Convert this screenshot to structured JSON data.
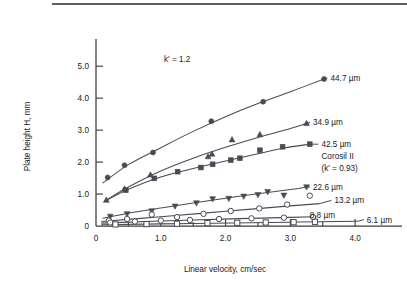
{
  "chart_data": {
    "type": "line",
    "title": "",
    "xlabel": "Linear velocity, cm/sec",
    "ylabel": "Plate height H, mm",
    "xlim": [
      0,
      4.6
    ],
    "ylim": [
      0,
      5.6
    ],
    "xticks": [
      "0",
      "1.0",
      "2.0",
      "3.0",
      "4.0"
    ],
    "xtick_values": [
      0,
      1.0,
      2.0,
      3.0,
      4.0
    ],
    "xminor_values": [
      0.5,
      1.5,
      2.5,
      3.5
    ],
    "yticks": [
      "0",
      "1.0",
      "2.0",
      "3.0",
      "4.0",
      "5.0"
    ],
    "ytick_values": [
      0,
      1.0,
      2.0,
      3.0,
      4.0,
      5.0
    ],
    "grid": false,
    "legend_position": "right-inline-labels",
    "annotations": [
      {
        "text": "k' = 1.2",
        "x": 1.05,
        "y": 5.12
      }
    ],
    "series": [
      {
        "name": "44.7 µm",
        "label": "44.7 µm",
        "marker": "filled-circle",
        "label_x": 3.62,
        "label_y": 4.62,
        "points": [
          {
            "x": 0.18,
            "y": 1.52
          },
          {
            "x": 0.44,
            "y": 1.9
          },
          {
            "x": 0.88,
            "y": 2.3
          },
          {
            "x": 1.78,
            "y": 3.28
          },
          {
            "x": 2.58,
            "y": 3.89
          },
          {
            "x": 3.52,
            "y": 4.6
          }
        ],
        "curve": [
          {
            "x": 0.1,
            "y": 1.34
          },
          {
            "x": 0.5,
            "y": 1.92
          },
          {
            "x": 1.0,
            "y": 2.45
          },
          {
            "x": 1.5,
            "y": 2.96
          },
          {
            "x": 2.0,
            "y": 3.42
          },
          {
            "x": 2.5,
            "y": 3.83
          },
          {
            "x": 3.0,
            "y": 4.2
          },
          {
            "x": 3.52,
            "y": 4.6
          }
        ]
      },
      {
        "name": "34.9 µm",
        "label": "34.9 µm",
        "marker": "filled-triangle-up",
        "label_x": 3.35,
        "label_y": 3.24,
        "points": [
          {
            "x": 0.16,
            "y": 0.81
          },
          {
            "x": 0.44,
            "y": 1.16
          },
          {
            "x": 0.84,
            "y": 1.6
          },
          {
            "x": 1.73,
            "y": 2.17
          },
          {
            "x": 1.79,
            "y": 2.25
          },
          {
            "x": 2.1,
            "y": 2.7
          },
          {
            "x": 2.53,
            "y": 2.86
          },
          {
            "x": 3.25,
            "y": 3.21
          }
        ],
        "curve": [
          {
            "x": 0.14,
            "y": 0.79
          },
          {
            "x": 0.5,
            "y": 1.22
          },
          {
            "x": 1.0,
            "y": 1.72
          },
          {
            "x": 1.5,
            "y": 2.12
          },
          {
            "x": 2.0,
            "y": 2.46
          },
          {
            "x": 2.5,
            "y": 2.77
          },
          {
            "x": 3.0,
            "y": 3.05
          },
          {
            "x": 3.25,
            "y": 3.21
          }
        ]
      },
      {
        "name": "42.5 µm Corosil II",
        "label": "42.5 µm",
        "label_line2": "Corosil II",
        "label_line3": "(k' = 0.93)",
        "marker": "filled-square",
        "label_x": 3.48,
        "label_y": 2.56,
        "points": [
          {
            "x": 0.46,
            "y": 1.12
          },
          {
            "x": 0.9,
            "y": 1.49
          },
          {
            "x": 1.26,
            "y": 1.7
          },
          {
            "x": 1.62,
            "y": 1.83
          },
          {
            "x": 1.8,
            "y": 1.93
          },
          {
            "x": 2.08,
            "y": 2.06
          },
          {
            "x": 2.22,
            "y": 2.12
          },
          {
            "x": 2.53,
            "y": 2.37
          },
          {
            "x": 2.88,
            "y": 2.48
          },
          {
            "x": 3.3,
            "y": 2.56
          }
        ],
        "curve": [
          {
            "x": 0.12,
            "y": 0.76
          },
          {
            "x": 0.5,
            "y": 1.15
          },
          {
            "x": 1.0,
            "y": 1.53
          },
          {
            "x": 1.5,
            "y": 1.8
          },
          {
            "x": 2.0,
            "y": 2.03
          },
          {
            "x": 2.5,
            "y": 2.26
          },
          {
            "x": 2.9,
            "y": 2.44
          },
          {
            "x": 3.3,
            "y": 2.56
          }
        ]
      },
      {
        "name": "22.6 µm",
        "label": "22.6 µm",
        "marker": "filled-triangle-down",
        "label_x": 3.35,
        "label_y": 1.22,
        "points": [
          {
            "x": 0.22,
            "y": 0.3
          },
          {
            "x": 0.48,
            "y": 0.38
          },
          {
            "x": 0.86,
            "y": 0.47
          },
          {
            "x": 1.22,
            "y": 0.62
          },
          {
            "x": 1.55,
            "y": 0.72
          },
          {
            "x": 1.8,
            "y": 0.85
          },
          {
            "x": 2.05,
            "y": 0.86
          },
          {
            "x": 2.28,
            "y": 0.93
          },
          {
            "x": 2.5,
            "y": 0.98
          },
          {
            "x": 2.65,
            "y": 1.07
          },
          {
            "x": 2.9,
            "y": 0.96
          },
          {
            "x": 3.25,
            "y": 1.22
          }
        ],
        "curve": [
          {
            "x": 0.1,
            "y": 0.24
          },
          {
            "x": 0.5,
            "y": 0.4
          },
          {
            "x": 1.0,
            "y": 0.56
          },
          {
            "x": 1.5,
            "y": 0.72
          },
          {
            "x": 2.0,
            "y": 0.87
          },
          {
            "x": 2.5,
            "y": 1.01
          },
          {
            "x": 3.0,
            "y": 1.14
          },
          {
            "x": 3.25,
            "y": 1.22
          }
        ]
      },
      {
        "name": "13.2 µm",
        "label": "13.2 µm",
        "marker": "open-circle",
        "label_x": 3.68,
        "label_y": 0.8,
        "points": [
          {
            "x": 0.2,
            "y": 0.17
          },
          {
            "x": 0.48,
            "y": 0.22
          },
          {
            "x": 0.86,
            "y": 0.36
          },
          {
            "x": 1.25,
            "y": 0.28
          },
          {
            "x": 1.66,
            "y": 0.38
          },
          {
            "x": 2.08,
            "y": 0.47
          },
          {
            "x": 2.52,
            "y": 0.55
          },
          {
            "x": 2.95,
            "y": 0.67
          },
          {
            "x": 3.3,
            "y": 0.95
          }
        ],
        "curve": [
          {
            "x": 0.08,
            "y": 0.14
          },
          {
            "x": 1.0,
            "y": 0.29
          },
          {
            "x": 2.0,
            "y": 0.46
          },
          {
            "x": 3.0,
            "y": 0.63
          },
          {
            "x": 3.45,
            "y": 0.7
          }
        ]
      },
      {
        "name": "8.8 µm",
        "label": "8.8 µm",
        "marker": "open-circle",
        "label_x": 3.3,
        "label_y": 0.33,
        "points": [
          {
            "x": 0.22,
            "y": 0.11
          },
          {
            "x": 0.6,
            "y": 0.14
          },
          {
            "x": 1.0,
            "y": 0.17
          },
          {
            "x": 1.45,
            "y": 0.19
          },
          {
            "x": 1.9,
            "y": 0.22
          },
          {
            "x": 2.4,
            "y": 0.24
          },
          {
            "x": 2.9,
            "y": 0.26
          },
          {
            "x": 3.35,
            "y": 0.28
          }
        ],
        "curve": [
          {
            "x": 0.08,
            "y": 0.09
          },
          {
            "x": 1.5,
            "y": 0.19
          },
          {
            "x": 3.0,
            "y": 0.27
          },
          {
            "x": 3.4,
            "y": 0.29
          }
        ]
      },
      {
        "name": "6.1 µm",
        "label": "6.1 µm",
        "marker": "open-square",
        "label_x": 4.18,
        "label_y": 0.2,
        "points": [
          {
            "x": 0.3,
            "y": 0.05
          },
          {
            "x": 0.78,
            "y": 0.06
          },
          {
            "x": 1.25,
            "y": 0.07
          },
          {
            "x": 1.72,
            "y": 0.09
          },
          {
            "x": 2.18,
            "y": 0.1
          },
          {
            "x": 2.62,
            "y": 0.11
          },
          {
            "x": 3.05,
            "y": 0.12
          },
          {
            "x": 3.38,
            "y": 0.13
          }
        ],
        "curve": [
          {
            "x": 0.08,
            "y": 0.04
          },
          {
            "x": 1.5,
            "y": 0.08
          },
          {
            "x": 3.0,
            "y": 0.12
          },
          {
            "x": 4.05,
            "y": 0.15
          }
        ]
      }
    ]
  },
  "colors": {
    "ink": "#4a4a55",
    "axis": "#3a3a3a",
    "text": "#1a1a1a",
    "rule": "#5d5d5d"
  }
}
